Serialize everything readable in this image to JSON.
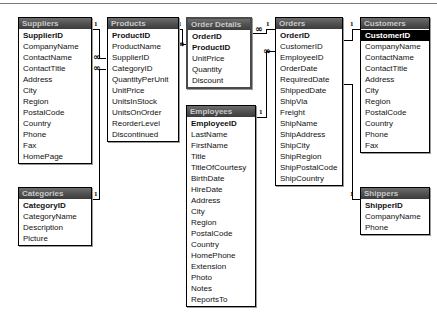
{
  "window": {
    "title": "Relationships",
    "type": "database-schema-diagram"
  },
  "markers": {
    "one": "1",
    "many": "∞"
  },
  "tables": [
    {
      "name": "Suppliers",
      "x": 18,
      "y": 12,
      "width": 74,
      "thick": false,
      "fields": [
        {
          "label": "SupplierID",
          "pk": true,
          "selected": false
        },
        {
          "label": "CompanyName",
          "pk": false,
          "selected": false
        },
        {
          "label": "ContactName",
          "pk": false,
          "selected": false
        },
        {
          "label": "ContactTitle",
          "pk": false,
          "selected": false
        },
        {
          "label": "Address",
          "pk": false,
          "selected": false
        },
        {
          "label": "City",
          "pk": false,
          "selected": false
        },
        {
          "label": "Region",
          "pk": false,
          "selected": false
        },
        {
          "label": "PostalCode",
          "pk": false,
          "selected": false
        },
        {
          "label": "Country",
          "pk": false,
          "selected": false
        },
        {
          "label": "Phone",
          "pk": false,
          "selected": false
        },
        {
          "label": "Fax",
          "pk": false,
          "selected": false
        },
        {
          "label": "HomePage",
          "pk": false,
          "selected": false
        }
      ]
    },
    {
      "name": "Categories",
      "x": 18,
      "y": 182,
      "width": 74,
      "thick": false,
      "fields": [
        {
          "label": "CategoryID",
          "pk": true,
          "selected": false
        },
        {
          "label": "CategoryName",
          "pk": false,
          "selected": false
        },
        {
          "label": "Description",
          "pk": false,
          "selected": false
        },
        {
          "label": "Picture",
          "pk": false,
          "selected": false
        }
      ]
    },
    {
      "name": "Products",
      "x": 107,
      "y": 12,
      "width": 72,
      "thick": false,
      "fields": [
        {
          "label": "ProductID",
          "pk": true,
          "selected": false
        },
        {
          "label": "ProductName",
          "pk": false,
          "selected": false
        },
        {
          "label": "SupplierID",
          "pk": false,
          "selected": false
        },
        {
          "label": "CategoryID",
          "pk": false,
          "selected": false
        },
        {
          "label": "QuantityPerUnit",
          "pk": false,
          "selected": false
        },
        {
          "label": "UnitPrice",
          "pk": false,
          "selected": false
        },
        {
          "label": "UnitsInStock",
          "pk": false,
          "selected": false
        },
        {
          "label": "UnitsOnOrder",
          "pk": false,
          "selected": false
        },
        {
          "label": "ReorderLevel",
          "pk": false,
          "selected": false
        },
        {
          "label": "Discontinued",
          "pk": false,
          "selected": false
        }
      ]
    },
    {
      "name": "Order Details",
      "x": 186,
      "y": 12,
      "width": 66,
      "thick": true,
      "fields": [
        {
          "label": "OrderID",
          "pk": true,
          "selected": false
        },
        {
          "label": "ProductID",
          "pk": true,
          "selected": false
        },
        {
          "label": "UnitPrice",
          "pk": false,
          "selected": false
        },
        {
          "label": "Quantity",
          "pk": false,
          "selected": false
        },
        {
          "label": "Discount",
          "pk": false,
          "selected": false
        }
      ]
    },
    {
      "name": "Employees",
      "x": 186,
      "y": 100,
      "width": 70,
      "thick": false,
      "fields": [
        {
          "label": "EmployeeID",
          "pk": true,
          "selected": false
        },
        {
          "label": "LastName",
          "pk": false,
          "selected": false
        },
        {
          "label": "FirstName",
          "pk": false,
          "selected": false
        },
        {
          "label": "Title",
          "pk": false,
          "selected": false
        },
        {
          "label": "TitleOfCourtesy",
          "pk": false,
          "selected": false
        },
        {
          "label": "BirthDate",
          "pk": false,
          "selected": false
        },
        {
          "label": "HireDate",
          "pk": false,
          "selected": false
        },
        {
          "label": "Address",
          "pk": false,
          "selected": false
        },
        {
          "label": "City",
          "pk": false,
          "selected": false
        },
        {
          "label": "Region",
          "pk": false,
          "selected": false
        },
        {
          "label": "PostalCode",
          "pk": false,
          "selected": false
        },
        {
          "label": "Country",
          "pk": false,
          "selected": false
        },
        {
          "label": "HomePhone",
          "pk": false,
          "selected": false
        },
        {
          "label": "Extension",
          "pk": false,
          "selected": false
        },
        {
          "label": "Photo",
          "pk": false,
          "selected": false
        },
        {
          "label": "Notes",
          "pk": false,
          "selected": false
        },
        {
          "label": "ReportsTo",
          "pk": false,
          "selected": false
        }
      ]
    },
    {
      "name": "Orders",
      "x": 275,
      "y": 12,
      "width": 68,
      "thick": false,
      "fields": [
        {
          "label": "OrderID",
          "pk": true,
          "selected": false
        },
        {
          "label": "CustomerID",
          "pk": false,
          "selected": false
        },
        {
          "label": "EmployeeID",
          "pk": false,
          "selected": false
        },
        {
          "label": "OrderDate",
          "pk": false,
          "selected": false
        },
        {
          "label": "RequiredDate",
          "pk": false,
          "selected": false
        },
        {
          "label": "ShippedDate",
          "pk": false,
          "selected": false
        },
        {
          "label": "ShipVia",
          "pk": false,
          "selected": false
        },
        {
          "label": "Freight",
          "pk": false,
          "selected": false
        },
        {
          "label": "ShipName",
          "pk": false,
          "selected": false
        },
        {
          "label": "ShipAddress",
          "pk": false,
          "selected": false
        },
        {
          "label": "ShipCity",
          "pk": false,
          "selected": false
        },
        {
          "label": "ShipRegion",
          "pk": false,
          "selected": false
        },
        {
          "label": "ShipPostalCode",
          "pk": false,
          "selected": false
        },
        {
          "label": "ShipCountry",
          "pk": false,
          "selected": false
        }
      ]
    },
    {
      "name": "Customers",
      "x": 360,
      "y": 12,
      "width": 70,
      "thick": false,
      "fields": [
        {
          "label": "CustomerID",
          "pk": true,
          "selected": true
        },
        {
          "label": "CompanyName",
          "pk": false,
          "selected": false
        },
        {
          "label": "ContactName",
          "pk": false,
          "selected": false
        },
        {
          "label": "ContactTitle",
          "pk": false,
          "selected": false
        },
        {
          "label": "Address",
          "pk": false,
          "selected": false
        },
        {
          "label": "City",
          "pk": false,
          "selected": false
        },
        {
          "label": "Region",
          "pk": false,
          "selected": false
        },
        {
          "label": "PostalCode",
          "pk": false,
          "selected": false
        },
        {
          "label": "Country",
          "pk": false,
          "selected": false
        },
        {
          "label": "Phone",
          "pk": false,
          "selected": false
        },
        {
          "label": "Fax",
          "pk": false,
          "selected": false
        }
      ]
    },
    {
      "name": "Shippers",
      "x": 360,
      "y": 182,
      "width": 70,
      "thick": false,
      "fields": [
        {
          "label": "ShipperID",
          "pk": true,
          "selected": false
        },
        {
          "label": "CompanyName",
          "pk": false,
          "selected": false
        },
        {
          "label": "Phone",
          "pk": false,
          "selected": false
        }
      ]
    }
  ],
  "relationships": [
    {
      "from": "Suppliers.SupplierID",
      "to": "Products.SupplierID",
      "one_side": "Suppliers",
      "many_side": "Products"
    },
    {
      "from": "Categories.CategoryID",
      "to": "Products.CategoryID",
      "one_side": "Categories",
      "many_side": "Products"
    },
    {
      "from": "Products.ProductID",
      "to": "Order Details.ProductID",
      "one_side": "Products",
      "many_side": "Order Details"
    },
    {
      "from": "Orders.OrderID",
      "to": "Order Details.OrderID",
      "one_side": "Orders",
      "many_side": "Order Details"
    },
    {
      "from": "Employees.EmployeeID",
      "to": "Orders.EmployeeID",
      "one_side": "Employees",
      "many_side": "Orders"
    },
    {
      "from": "Customers.CustomerID",
      "to": "Orders.CustomerID",
      "one_side": "Customers",
      "many_side": "Orders"
    },
    {
      "from": "Shippers.ShipperID",
      "to": "Orders.ShipVia",
      "one_side": "Shippers",
      "many_side": "Orders"
    }
  ]
}
